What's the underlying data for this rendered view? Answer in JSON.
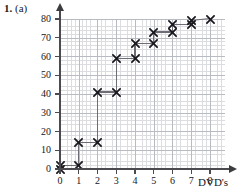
{
  "question": {
    "number": "1.",
    "part": "(a)"
  },
  "chart_data": {
    "type": "line",
    "title": "",
    "subtitle": "",
    "xlabel": "DVD's",
    "ylabel": "",
    "xlim": [
      0,
      8
    ],
    "ylim": [
      0,
      80
    ],
    "grid": true,
    "legend": null,
    "marker": "x-cross",
    "style": "cumulative-step-graph",
    "x_ticks": [
      "0",
      "1",
      "2",
      "3",
      "4",
      "5",
      "6",
      "7",
      "8"
    ],
    "y_ticks": [
      "0",
      "10",
      "20",
      "30",
      "40",
      "50",
      "60",
      "70",
      "80"
    ],
    "x_tick_values": [
      0,
      1,
      2,
      3,
      4,
      5,
      6,
      7,
      8
    ],
    "y_tick_values": [
      0,
      10,
      20,
      30,
      40,
      50,
      60,
      70,
      80
    ],
    "points": [
      {
        "x": 0,
        "y": 0
      },
      {
        "x": 0,
        "y": 2
      },
      {
        "x": 1,
        "y": 2
      },
      {
        "x": 1,
        "y": 14
      },
      {
        "x": 2,
        "y": 14
      },
      {
        "x": 2,
        "y": 41
      },
      {
        "x": 3,
        "y": 41
      },
      {
        "x": 3,
        "y": 59
      },
      {
        "x": 4,
        "y": 59
      },
      {
        "x": 4,
        "y": 67
      },
      {
        "x": 5,
        "y": 67
      },
      {
        "x": 5,
        "y": 73
      },
      {
        "x": 6,
        "y": 73
      },
      {
        "x": 6,
        "y": 77
      },
      {
        "x": 7,
        "y": 77
      },
      {
        "x": 7,
        "y": 79
      },
      {
        "x": 8,
        "y": 80
      }
    ],
    "segments": [
      {
        "x1": 0,
        "y1": 0,
        "x2": 0,
        "y2": 2
      },
      {
        "x1": 0,
        "y1": 2,
        "x2": 1,
        "y2": 2
      },
      {
        "x1": 1,
        "y1": 2,
        "x2": 1,
        "y2": 14
      },
      {
        "x1": 1,
        "y1": 14,
        "x2": 2,
        "y2": 14
      },
      {
        "x1": 2,
        "y1": 14,
        "x2": 2,
        "y2": 41
      },
      {
        "x1": 2,
        "y1": 41,
        "x2": 3,
        "y2": 41
      },
      {
        "x1": 3,
        "y1": 41,
        "x2": 3,
        "y2": 59
      },
      {
        "x1": 3,
        "y1": 59,
        "x2": 4,
        "y2": 59
      },
      {
        "x1": 4,
        "y1": 59,
        "x2": 4,
        "y2": 67
      },
      {
        "x1": 4,
        "y1": 67,
        "x2": 5,
        "y2": 67
      },
      {
        "x1": 5,
        "y1": 67,
        "x2": 5,
        "y2": 73
      },
      {
        "x1": 5,
        "y1": 73,
        "x2": 6,
        "y2": 73
      },
      {
        "x1": 6,
        "y1": 73,
        "x2": 6,
        "y2": 77
      },
      {
        "x1": 6,
        "y1": 77,
        "x2": 7,
        "y2": 77
      },
      {
        "x1": 7,
        "y1": 77,
        "x2": 7,
        "y2": 79
      },
      {
        "x1": 7,
        "y1": 79,
        "x2": 8,
        "y2": 80
      }
    ],
    "colors": {
      "line": "#6d6d75",
      "marker": "#17171c",
      "axis": "#4a4a4f",
      "grid_minor": "#dcdde1",
      "grid_major": "#b9bbc2",
      "background": "#ffffff"
    }
  }
}
